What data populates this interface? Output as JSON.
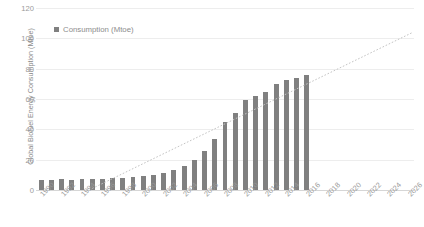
{
  "chart_data": {
    "type": "bar",
    "title": "",
    "subtitle": "",
    "xlabel": "",
    "ylabel": "Global Biofuel Energy Consumption (Mtoe)",
    "ylim": [
      0,
      120
    ],
    "yticks": [
      0,
      20,
      40,
      60,
      80,
      100,
      120
    ],
    "grid": true,
    "legend_position": "top-left",
    "legend": [
      "Consumption (Mtoe)"
    ],
    "x_axis_tick_labels": [
      "1990",
      "1992",
      "1994",
      "1996",
      "1998",
      "2000",
      "2002",
      "2004",
      "2006",
      "2008",
      "2010",
      "2012",
      "2014",
      "2016",
      "2018",
      "2020",
      "2022",
      "2024",
      "2026"
    ],
    "x_axis_domain": [
      "1990",
      "2026"
    ],
    "categories": [
      "1990",
      "1991",
      "1992",
      "1993",
      "1994",
      "1995",
      "1996",
      "1997",
      "1998",
      "1999",
      "2000",
      "2001",
      "2002",
      "2003",
      "2004",
      "2005",
      "2006",
      "2007",
      "2008",
      "2009",
      "2010",
      "2011",
      "2012",
      "2013",
      "2014",
      "2015",
      "2016"
    ],
    "series": [
      {
        "name": "Consumption (Mtoe)",
        "color": "#808080",
        "values": [
          6.5,
          6.8,
          7.0,
          6.8,
          7.2,
          7.4,
          7.0,
          7.6,
          8.0,
          8.5,
          9.2,
          9.8,
          11.5,
          13.5,
          16.0,
          19.5,
          25.5,
          33.5,
          45.0,
          50.5,
          59.5,
          62.0,
          64.5,
          70.0,
          72.5,
          74.0,
          76.0
        ]
      }
    ],
    "trendline": {
      "type": "linear-dotted",
      "color": "#c4c4c4",
      "start": {
        "x_category": "1995",
        "y": 1.0
      },
      "end": {
        "x_category": "2026",
        "y": 104.0
      }
    },
    "colors": {
      "bar": "#808080",
      "gridline": "#ededed",
      "axis": "#d6d6d6",
      "tick_text": "#9a9a9a",
      "axis_title": "#8a8a8a",
      "trendline": "#c4c4c4",
      "background": "#ffffff"
    }
  }
}
